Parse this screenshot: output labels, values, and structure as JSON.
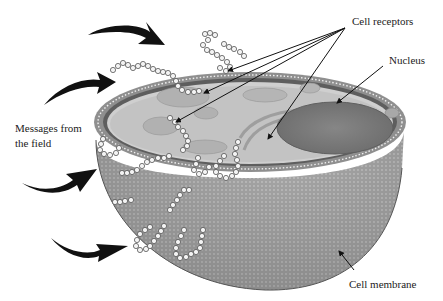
{
  "diagram": {
    "labels": {
      "cell_receptors": "Cell receptors",
      "nucleus": "Nucleus",
      "messages_line1": "Messages from",
      "messages_line2": "the field",
      "cell_membrane": "Cell membrane"
    },
    "colors": {
      "background": "#ffffff",
      "cytoplasm_top": "#cfcfcf",
      "cell_body": "#a9a9a9",
      "membrane_ring": "#6e6e6e",
      "nucleus": "#7d7d7d",
      "organelle": "#b8b8b8",
      "arrow": "#111111",
      "receptor_bead": "#f4f4f4"
    },
    "incoming_arrow_count": 4,
    "receptor_pointer_count": 4
  }
}
